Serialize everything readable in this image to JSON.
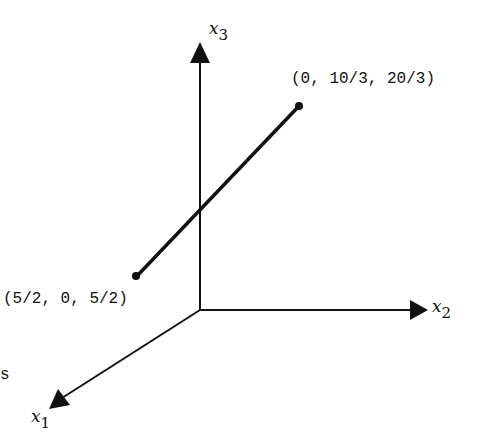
{
  "diagram": {
    "axes": {
      "x1": {
        "name": "x",
        "sub": "1"
      },
      "x2": {
        "name": "x",
        "sub": "2"
      },
      "x3": {
        "name": "x",
        "sub": "3"
      }
    },
    "points": [
      {
        "label": "(0, 10/3, 20/3)",
        "coords": [
          0,
          3.3333,
          6.6667
        ]
      },
      {
        "label": "(5/2, 0, 5/2)",
        "coords": [
          2.5,
          0,
          2.5
        ]
      }
    ],
    "stray_text": "s",
    "colors": {
      "ink": "#111111",
      "background": "#ffffff"
    }
  }
}
